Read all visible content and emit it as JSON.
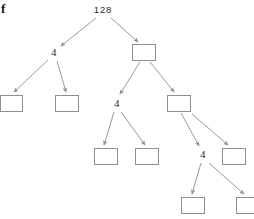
{
  "figure": {
    "label": "f",
    "width": 254,
    "height": 219,
    "background": "#ffffff",
    "edge_color": "#9a9a9f",
    "box_border_color": "#8e8e94",
    "text_color": "#2a2a2a"
  },
  "tree": {
    "description": "binary tree diagram with labeled and blank rectangular nodes connected by gray arrows",
    "nodes": [
      {
        "id": "n0",
        "label": "128",
        "kind": "text",
        "x": 103,
        "y": 10,
        "level": 1
      },
      {
        "id": "n1",
        "label": "4",
        "kind": "text",
        "x": 54,
        "y": 53,
        "level": 2
      },
      {
        "id": "n2",
        "label": "",
        "kind": "box",
        "x": 144,
        "y": 52,
        "level": 2,
        "left": 132,
        "top": 44,
        "width": 24,
        "height": 17
      },
      {
        "id": "n3",
        "label": "",
        "kind": "box",
        "x": 11,
        "y": 103,
        "level": 3,
        "left": 0,
        "top": 95,
        "width": 23,
        "height": 17
      },
      {
        "id": "n4",
        "label": "",
        "kind": "box",
        "x": 67,
        "y": 103,
        "level": 3,
        "left": 55,
        "top": 95,
        "width": 24,
        "height": 17
      },
      {
        "id": "n5",
        "label": "4",
        "kind": "text",
        "x": 117,
        "y": 104,
        "level": 3
      },
      {
        "id": "n6",
        "label": "",
        "kind": "box",
        "x": 179,
        "y": 103,
        "level": 3,
        "left": 167,
        "top": 95,
        "width": 24,
        "height": 17
      },
      {
        "id": "n7",
        "label": "",
        "kind": "box",
        "x": 106,
        "y": 156,
        "level": 4,
        "left": 94,
        "top": 148,
        "width": 24,
        "height": 17
      },
      {
        "id": "n8",
        "label": "",
        "kind": "box",
        "x": 147,
        "y": 156,
        "level": 4,
        "left": 135,
        "top": 148,
        "width": 24,
        "height": 17
      },
      {
        "id": "n9",
        "label": "4",
        "kind": "text",
        "x": 203,
        "y": 155,
        "level": 4
      },
      {
        "id": "n10",
        "label": "",
        "kind": "box",
        "x": 234,
        "y": 156,
        "level": 4,
        "left": 222,
        "top": 148,
        "width": 24,
        "height": 17
      },
      {
        "id": "n11",
        "label": "",
        "kind": "box",
        "x": 193,
        "y": 205,
        "level": 5,
        "left": 181,
        "top": 197,
        "width": 24,
        "height": 17
      },
      {
        "id": "n12",
        "label": "",
        "kind": "box",
        "x": 248,
        "y": 205,
        "level": 5,
        "left": 236,
        "top": 197,
        "width": 24,
        "height": 17
      }
    ],
    "edges": [
      {
        "from": "n0",
        "to": "n1",
        "x1": 96,
        "y1": 18,
        "x2": 61,
        "y2": 46
      },
      {
        "from": "n0",
        "to": "n2",
        "x1": 111,
        "y1": 18,
        "x2": 138,
        "y2": 42
      },
      {
        "from": "n1",
        "to": "n3",
        "x1": 48,
        "y1": 60,
        "x2": 14,
        "y2": 92
      },
      {
        "from": "n1",
        "to": "n4",
        "x1": 57,
        "y1": 61,
        "x2": 66,
        "y2": 92
      },
      {
        "from": "n2",
        "to": "n5",
        "x1": 140,
        "y1": 62,
        "x2": 120,
        "y2": 94
      },
      {
        "from": "n2",
        "to": "n6",
        "x1": 150,
        "y1": 62,
        "x2": 174,
        "y2": 92
      },
      {
        "from": "n5",
        "to": "n7",
        "x1": 114,
        "y1": 112,
        "x2": 104,
        "y2": 145
      },
      {
        "from": "n5",
        "to": "n8",
        "x1": 121,
        "y1": 112,
        "x2": 145,
        "y2": 145
      },
      {
        "from": "n6",
        "to": "n9",
        "x1": 181,
        "y1": 113,
        "x2": 199,
        "y2": 146
      },
      {
        "from": "n6",
        "to": "n10",
        "x1": 192,
        "y1": 114,
        "x2": 228,
        "y2": 145
      },
      {
        "from": "n9",
        "to": "n11",
        "x1": 201,
        "y1": 163,
        "x2": 192,
        "y2": 194
      },
      {
        "from": "n9",
        "to": "n12",
        "x1": 209,
        "y1": 163,
        "x2": 244,
        "y2": 194
      }
    ]
  }
}
